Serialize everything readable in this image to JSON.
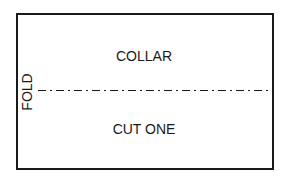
{
  "diagram": {
    "type": "sewing-pattern-piece",
    "piece_name": "COLLAR",
    "instruction": "CUT ONE",
    "fold_label": "FOLD",
    "fold_line_style": "dash-dot",
    "colors": {
      "stroke": "#1a1a1a",
      "background": "#ffffff"
    }
  }
}
